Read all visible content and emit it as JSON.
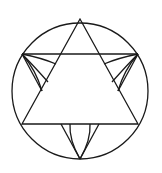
{
  "diagram": {
    "title": "",
    "stroke_color": "#1a1a1a",
    "background": "#ffffff",
    "circle": {
      "cx": 80,
      "cy": 91,
      "r": 68
    },
    "main_triangle": {
      "points": [
        [
          80,
          19
        ],
        [
          22,
          124
        ],
        [
          138,
          124
        ]
      ]
    },
    "chord_top": {
      "x1": 22,
      "y1": 54,
      "x2": 138,
      "y2": 54
    },
    "bottom_vertex": [
      80,
      159
    ],
    "elements": [
      "circle",
      "inscribed-triangle",
      "horizontal-chord",
      "left-petal-arcs",
      "right-petal-arcs",
      "bottom-petal-arcs"
    ]
  }
}
